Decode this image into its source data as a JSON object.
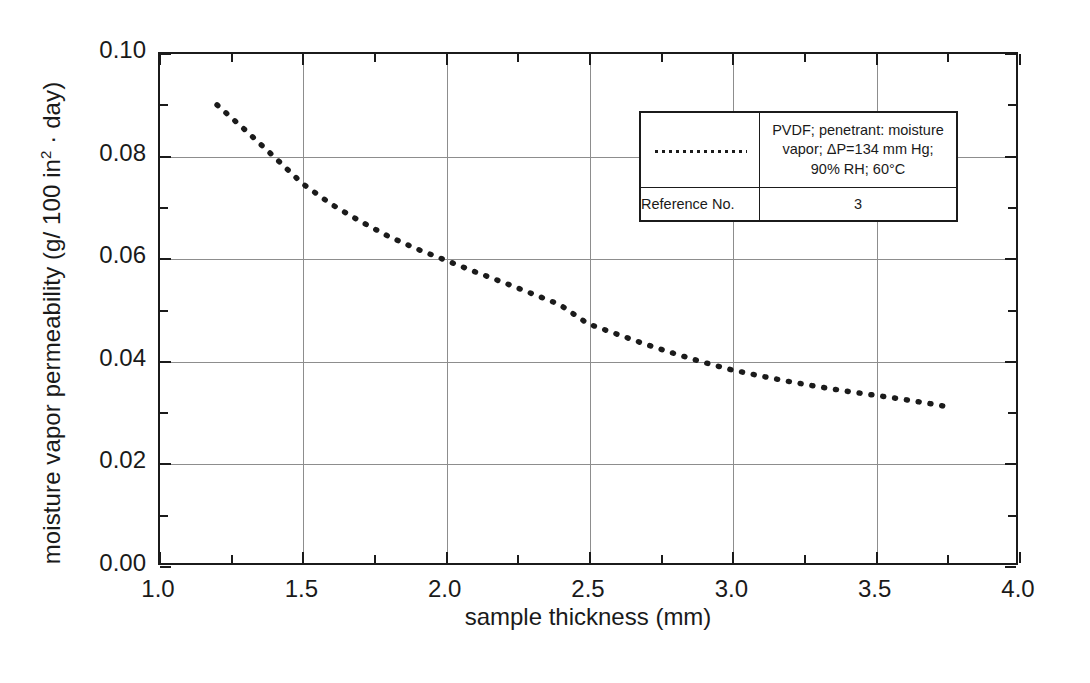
{
  "chart_data": {
    "type": "line",
    "title": "",
    "xlabel": "sample thickness (mm)",
    "ylabel_text": "moisture vapor permeability (g/ 100 in",
    "ylabel_sup": "2",
    "ylabel_tail": " · day)",
    "xlim": [
      1.0,
      4.0
    ],
    "ylim": [
      0.0,
      0.1
    ],
    "x_ticks": [
      1.0,
      1.5,
      2.0,
      2.5,
      3.0,
      3.5,
      4.0
    ],
    "x_tick_labels": [
      "1.0",
      "1.5",
      "2.0",
      "2.5",
      "3.0",
      "3.5",
      "4.0"
    ],
    "x_minor_ticks": [
      1.25,
      1.75,
      2.25,
      2.75,
      3.25,
      3.75
    ],
    "y_ticks": [
      0.0,
      0.02,
      0.04,
      0.06,
      0.08,
      0.1
    ],
    "y_tick_labels": [
      "0.00",
      "0.02",
      "0.04",
      "0.06",
      "0.08",
      "0.10"
    ],
    "y_minor_ticks": [
      0.01,
      0.03,
      0.05,
      0.07,
      0.09
    ],
    "grid": true,
    "grid_color": "#8d8d8d",
    "legend_position": "top-right-inside",
    "line_color": "#1b1b1b",
    "line_style": "dotted",
    "series": [
      {
        "name": "PVDF moisture vapor permeability",
        "x": [
          1.2,
          1.3,
          1.4,
          1.5,
          1.6,
          1.7,
          1.8,
          1.9,
          2.0,
          2.1,
          2.2,
          2.3,
          2.4,
          2.5,
          2.6,
          2.7,
          2.8,
          2.9,
          3.0,
          3.1,
          3.2,
          3.3,
          3.4,
          3.5,
          3.6,
          3.7,
          3.78
        ],
        "y": [
          0.09,
          0.085,
          0.0798,
          0.0745,
          0.0705,
          0.0672,
          0.0642,
          0.0617,
          0.0595,
          0.0573,
          0.0552,
          0.053,
          0.0508,
          0.047,
          0.045,
          0.043,
          0.0412,
          0.0395,
          0.038,
          0.0368,
          0.0357,
          0.0347,
          0.0338,
          0.033,
          0.0322,
          0.0313,
          0.0305
        ]
      }
    ]
  },
  "axis": {
    "y_label_full": "moisture vapor permeability (g/ 100 in",
    "y_label_sup": "2",
    "y_label_after": " · day)",
    "x_label": "sample thickness (mm)"
  },
  "legend": {
    "sample_line_name": "dotted-line-swatch",
    "description_line1": "PVDF; penetrant: moisture",
    "description_line2": "vapor; ΔP=134 mm Hg;",
    "description_line3": "90% RH; 60°C",
    "reference_label": "Reference No.",
    "reference_value": "3"
  }
}
